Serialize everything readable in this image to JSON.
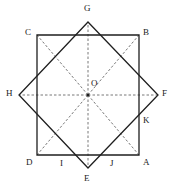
{
  "figure": {
    "background_color": "#ffffff",
    "solid_stroke_color": "#1f1f1f",
    "dashed_stroke_color": "#555555",
    "label_color": "#1a1a1a",
    "center_label": "O",
    "center_point": {
      "x": 88,
      "y": 95
    },
    "axis_square": {
      "name": "axis-aligned-square",
      "corner_labels": [
        "C",
        "B",
        "A",
        "D"
      ],
      "points": [
        {
          "label": "C",
          "x": 37,
          "y": 35
        },
        {
          "label": "B",
          "x": 139,
          "y": 35
        },
        {
          "label": "A",
          "x": 139,
          "y": 155
        },
        {
          "label": "D",
          "x": 37,
          "y": 155
        }
      ]
    },
    "rotated_square": {
      "name": "rotated-square",
      "vertex_labels": [
        "G",
        "F",
        "E",
        "H"
      ],
      "points": [
        {
          "label": "G",
          "x": 88,
          "y": 22
        },
        {
          "label": "F",
          "x": 158,
          "y": 95
        },
        {
          "label": "E",
          "x": 88,
          "y": 168
        },
        {
          "label": "H",
          "x": 19,
          "y": 95
        }
      ]
    },
    "intersection_labels": [
      "I",
      "J",
      "K"
    ],
    "intersection_points": [
      {
        "label": "I",
        "x": 62,
        "y": 155
      },
      {
        "label": "J",
        "x": 113,
        "y": 155
      },
      {
        "label": "K",
        "x": 139,
        "y": 122
      }
    ],
    "labels": [
      {
        "id": "label-g",
        "text": "G",
        "left": 84,
        "top": 4
      },
      {
        "id": "label-c",
        "text": "C",
        "left": 25,
        "top": 28
      },
      {
        "id": "label-b",
        "text": "B",
        "left": 143,
        "top": 28
      },
      {
        "id": "label-h",
        "text": "H",
        "left": 6,
        "top": 89
      },
      {
        "id": "label-o",
        "text": "O",
        "left": 91,
        "top": 79
      },
      {
        "id": "label-f",
        "text": "F",
        "left": 162,
        "top": 89
      },
      {
        "id": "label-k",
        "text": "K",
        "left": 143,
        "top": 116
      },
      {
        "id": "label-d",
        "text": "D",
        "left": 26,
        "top": 158
      },
      {
        "id": "label-a",
        "text": "A",
        "left": 143,
        "top": 158
      },
      {
        "id": "label-i",
        "text": "I",
        "left": 60,
        "top": 159
      },
      {
        "id": "label-j",
        "text": "J",
        "left": 110,
        "top": 159
      },
      {
        "id": "label-e",
        "text": "E",
        "left": 84,
        "top": 174
      }
    ],
    "dashed_rays": [
      {
        "name": "ray-o-to-g",
        "x2": 88,
        "y2": 22
      },
      {
        "name": "ray-o-to-b",
        "x2": 139,
        "y2": 35
      },
      {
        "name": "ray-o-to-f",
        "x2": 158,
        "y2": 95
      },
      {
        "name": "ray-o-to-a",
        "x2": 139,
        "y2": 155
      },
      {
        "name": "ray-o-to-e",
        "x2": 88,
        "y2": 168
      },
      {
        "name": "ray-o-to-d",
        "x2": 37,
        "y2": 155
      },
      {
        "name": "ray-o-to-h",
        "x2": 19,
        "y2": 95
      },
      {
        "name": "ray-o-to-c",
        "x2": 37,
        "y2": 35
      }
    ]
  }
}
